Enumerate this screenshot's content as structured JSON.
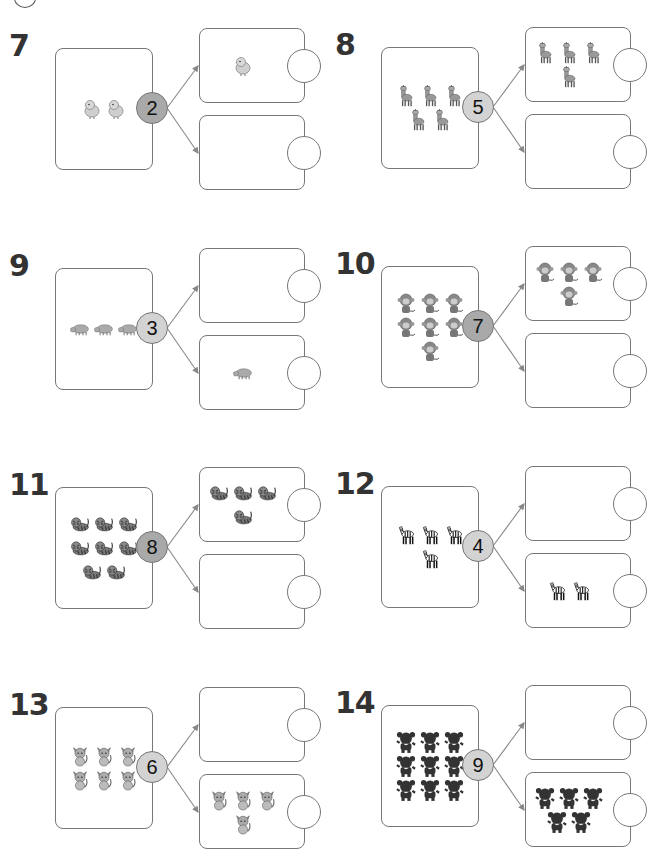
{
  "worksheet": {
    "header_icon": "clock-icon",
    "colors": {
      "border": "#777777",
      "circle_dark": "#a9a9a9",
      "circle_light": "#d3d3d3",
      "text": "#333333"
    },
    "problems": [
      {
        "number": "7",
        "total": "2",
        "animal": "chick",
        "top_count": 1,
        "bottom_count": 0,
        "circle_shade": "dark"
      },
      {
        "number": "8",
        "total": "5",
        "animal": "giraffe",
        "top_count": 4,
        "bottom_count": 0,
        "circle_shade": "light"
      },
      {
        "number": "9",
        "total": "3",
        "animal": "hippo",
        "top_count": 0,
        "bottom_count": 1,
        "circle_shade": "light"
      },
      {
        "number": "10",
        "total": "7",
        "animal": "monkey",
        "top_count": 4,
        "bottom_count": 0,
        "circle_shade": "dark"
      },
      {
        "number": "11",
        "total": "8",
        "animal": "tiger",
        "top_count": 4,
        "bottom_count": 0,
        "circle_shade": "dark"
      },
      {
        "number": "12",
        "total": "4",
        "animal": "zebra",
        "top_count": 0,
        "bottom_count": 2,
        "circle_shade": "light"
      },
      {
        "number": "13",
        "total": "6",
        "animal": "cat",
        "top_count": 0,
        "bottom_count": 4,
        "circle_shade": "light"
      },
      {
        "number": "14",
        "total": "9",
        "animal": "bear",
        "top_count": 0,
        "bottom_count": 5,
        "circle_shade": "light"
      }
    ]
  }
}
